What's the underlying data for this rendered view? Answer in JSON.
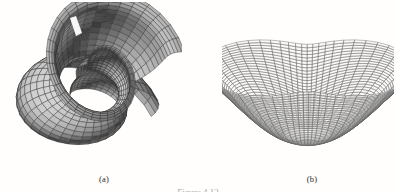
{
  "figure": {
    "background_color": "#fffefd",
    "panels": [
      {
        "id": "panel-a",
        "sublabel": "(a)",
        "render_style": "shaded-mesh",
        "description": "shaded spiral scroll surface",
        "mesh_color": "#3a3a3a",
        "fill_light": "#d8d6d2",
        "fill_dark": "#595856"
      },
      {
        "id": "panel-b",
        "sublabel": "(b)",
        "render_style": "wireframe-mesh",
        "description": "wireframe flared funnel surface with two lobes",
        "mesh_color": "#5a5a5a",
        "fill_light": "#f2f1ef",
        "fill_dark": "#b8b6b2"
      }
    ],
    "caption": "Figure 4.12"
  },
  "chart_data": {
    "type": "surface",
    "title": "",
    "panels": [
      {
        "label": "(a)",
        "surface": "spiral-scroll",
        "shading": "shaded",
        "u_range": [
          0,
          6.283185
        ],
        "v_range": [
          0,
          6.283185
        ],
        "grid_u": 40,
        "grid_v": 40
      },
      {
        "label": "(b)",
        "surface": "flared-funnel",
        "shading": "wireframe",
        "u_range": [
          0,
          6.283185
        ],
        "v_range": [
          0,
          3.141593
        ],
        "grid_u": 44,
        "grid_v": 30
      }
    ],
    "xlabel": "",
    "ylabel": "",
    "legend": []
  }
}
